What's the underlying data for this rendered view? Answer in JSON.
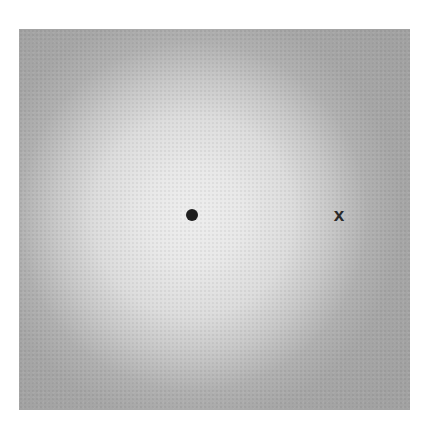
{
  "stimulus": {
    "background_color": "#a6a6a6",
    "glow_center_color": "#ededed",
    "fixation_symbol": "dot",
    "target_symbol": "x"
  }
}
